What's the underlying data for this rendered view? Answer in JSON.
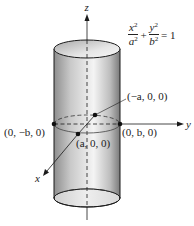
{
  "figure": {
    "type": "elliptic-cylinder",
    "axes": {
      "z_label": "z",
      "y_label": "y",
      "x_label": "x"
    },
    "equation": {
      "term1_num": "x",
      "term1_den": "a",
      "term2_num": "y",
      "term2_den": "b",
      "exp": "2",
      "plus": "+",
      "equals": "= 1"
    },
    "points": [
      {
        "label": "(−a, 0, 0)",
        "id": "neg-a"
      },
      {
        "label": "(a, 0, 0)",
        "id": "pos-a"
      },
      {
        "label": "(0, −b, 0)",
        "id": "neg-b"
      },
      {
        "label": "(0, b, 0)",
        "id": "pos-b"
      }
    ],
    "colors": {
      "stroke": "#1a1a1a",
      "surface_light": "#f2f2f2",
      "surface_dark": "#8c8c8c"
    }
  }
}
